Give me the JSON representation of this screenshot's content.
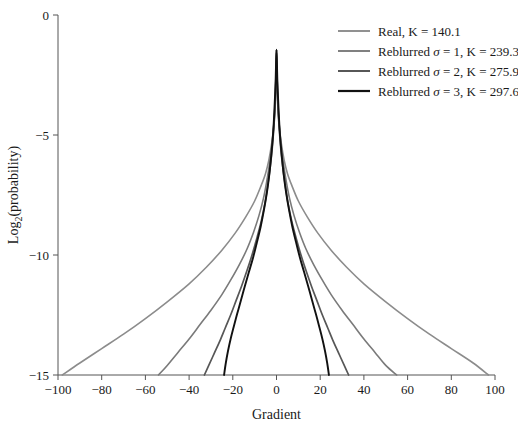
{
  "chart_data": {
    "type": "line",
    "title": "",
    "xlabel": "Gradient",
    "ylabel": "Log2(probability)",
    "ylabel_base": "Log",
    "ylabel_sub": "2",
    "ylabel_rest": "(probability)",
    "xlim": [
      -100,
      100
    ],
    "ylim": [
      -15,
      0
    ],
    "xticks": [
      -100,
      -80,
      -60,
      -40,
      -20,
      0,
      20,
      40,
      60,
      80,
      100
    ],
    "xtick_labels": [
      "−100",
      "−80",
      "−60",
      "−40",
      "−20",
      "0",
      "20",
      "40",
      "60",
      "80",
      "100"
    ],
    "yticks": [
      0,
      -5,
      -10,
      -15
    ],
    "ytick_labels": [
      "0",
      "−5",
      "−10",
      "−15"
    ],
    "grid": false,
    "legend_position": "top-right",
    "peak": {
      "x": 0,
      "y": -1.45
    },
    "series": [
      {
        "name": "Real, K = 140.1",
        "label_prefix": "Real, K = ",
        "sigma": null,
        "K": 140.1,
        "color": "#8c8c8c",
        "linewidth": 1.6,
        "x": [
          -98,
          -90,
          -80,
          -70,
          -60,
          -50,
          -40,
          -32,
          -25,
          -19,
          -14,
          -10,
          -7,
          -5,
          -3.5,
          -2.2,
          -1.3,
          -0.6,
          -0.2,
          0,
          0.2,
          0.6,
          1.3,
          2.2,
          3.5,
          5,
          7,
          10,
          14,
          19,
          25,
          32,
          40,
          50,
          60,
          70,
          80,
          90,
          97
        ],
        "y": [
          -15,
          -14.5,
          -13.9,
          -13.3,
          -12.65,
          -11.95,
          -11.2,
          -10.5,
          -9.8,
          -9.1,
          -8.4,
          -7.75,
          -7.1,
          -6.6,
          -6.05,
          -5.35,
          -4.65,
          -3.8,
          -2.6,
          -1.45,
          -2.6,
          -3.8,
          -4.65,
          -5.35,
          -6.05,
          -6.6,
          -7.1,
          -7.75,
          -8.4,
          -9.1,
          -9.8,
          -10.5,
          -11.2,
          -11.95,
          -12.65,
          -13.3,
          -13.9,
          -14.5,
          -15
        ]
      },
      {
        "name": "Reblurred σ = 1, K = 239.3",
        "label_prefix": "Reblurred ",
        "label_mid": " = 1, K = ",
        "sigma": 1,
        "K": 239.3,
        "color": "#7a7a7a",
        "linewidth": 1.6,
        "x": [
          -54,
          -50,
          -45,
          -40,
          -35,
          -30,
          -25,
          -21,
          -17,
          -13.5,
          -10.5,
          -8,
          -6,
          -4.5,
          -3.2,
          -2.2,
          -1.4,
          -0.8,
          -0.3,
          0,
          0.3,
          0.8,
          1.4,
          2.2,
          3.2,
          4.5,
          6,
          8,
          10.5,
          13.5,
          17,
          21,
          25,
          30,
          35,
          40,
          45,
          50,
          55
        ],
        "y": [
          -15,
          -14.6,
          -14.05,
          -13.5,
          -12.9,
          -12.3,
          -11.65,
          -11.05,
          -10.4,
          -9.75,
          -9.05,
          -8.35,
          -7.65,
          -6.95,
          -6.2,
          -5.5,
          -4.75,
          -3.9,
          -2.7,
          -1.45,
          -2.7,
          -3.9,
          -4.75,
          -5.5,
          -6.2,
          -6.95,
          -7.65,
          -8.35,
          -9.05,
          -9.75,
          -10.4,
          -11.05,
          -11.65,
          -12.3,
          -12.9,
          -13.5,
          -14.05,
          -14.6,
          -15
        ]
      },
      {
        "name": "Reblurred σ = 2, K = 275.9",
        "label_prefix": "Reblurred ",
        "label_mid": " = 2, K = ",
        "sigma": 2,
        "K": 275.9,
        "color": "#575757",
        "linewidth": 1.7,
        "x": [
          -33,
          -31,
          -28.5,
          -26,
          -23.5,
          -21,
          -18.5,
          -16,
          -13.5,
          -11.2,
          -9,
          -7,
          -5.3,
          -4,
          -2.9,
          -2,
          -1.3,
          -0.75,
          -0.3,
          0,
          0.3,
          0.75,
          1.3,
          2,
          2.9,
          4,
          5.3,
          7,
          9,
          11.2,
          13.5,
          16,
          18.5,
          21,
          23.5,
          26,
          28.5,
          31,
          33
        ],
        "y": [
          -15,
          -14.6,
          -14.1,
          -13.6,
          -13.05,
          -12.5,
          -11.9,
          -11.3,
          -10.65,
          -10.0,
          -9.3,
          -8.6,
          -7.85,
          -7.1,
          -6.35,
          -5.6,
          -4.8,
          -3.95,
          -2.7,
          -1.45,
          -2.7,
          -3.95,
          -4.8,
          -5.6,
          -6.35,
          -7.1,
          -7.85,
          -8.6,
          -9.3,
          -10.0,
          -10.65,
          -11.3,
          -11.9,
          -12.5,
          -13.05,
          -13.6,
          -14.1,
          -14.6,
          -15
        ]
      },
      {
        "name": "Reblurred σ = 3, K = 297.6",
        "label_prefix": "Reblurred ",
        "label_mid": " = 3, K = ",
        "sigma": 3,
        "K": 297.6,
        "color": "#111111",
        "linewidth": 1.9,
        "x": [
          -24,
          -23.2,
          -22.2,
          -21,
          -19.6,
          -18,
          -16.3,
          -14.5,
          -12.6,
          -10.7,
          -8.9,
          -7.2,
          -5.7,
          -4.4,
          -3.3,
          -2.4,
          -1.6,
          -1.0,
          -0.4,
          0,
          0.4,
          1.0,
          1.6,
          2.4,
          3.3,
          4.4,
          5.7,
          7.2,
          8.9,
          10.7,
          12.6,
          14.5,
          16.3,
          18,
          19.6,
          21,
          22.2,
          23.2,
          24
        ],
        "y": [
          -15,
          -14.5,
          -14.0,
          -13.5,
          -13.0,
          -12.45,
          -11.9,
          -11.3,
          -10.7,
          -10.1,
          -9.45,
          -8.8,
          -8.1,
          -7.4,
          -6.65,
          -5.85,
          -5.0,
          -4.05,
          -2.75,
          -1.45,
          -2.75,
          -4.05,
          -5.0,
          -5.85,
          -6.65,
          -7.4,
          -8.1,
          -8.8,
          -9.45,
          -10.1,
          -10.7,
          -11.3,
          -11.9,
          -12.45,
          -13.0,
          -13.5,
          -14.0,
          -14.5,
          -15
        ]
      }
    ],
    "legend_entries": [
      {
        "text": "Real, K = 140.1",
        "color": "#8c8c8c"
      },
      {
        "text": "Reblurred σ = 1, K = 239.3",
        "color": "#7a7a7a"
      },
      {
        "text": "Reblurred σ = 2, K = 275.9",
        "color": "#575757"
      },
      {
        "text": "Reblurred σ = 3, K = 297.6",
        "color": "#111111"
      }
    ]
  }
}
